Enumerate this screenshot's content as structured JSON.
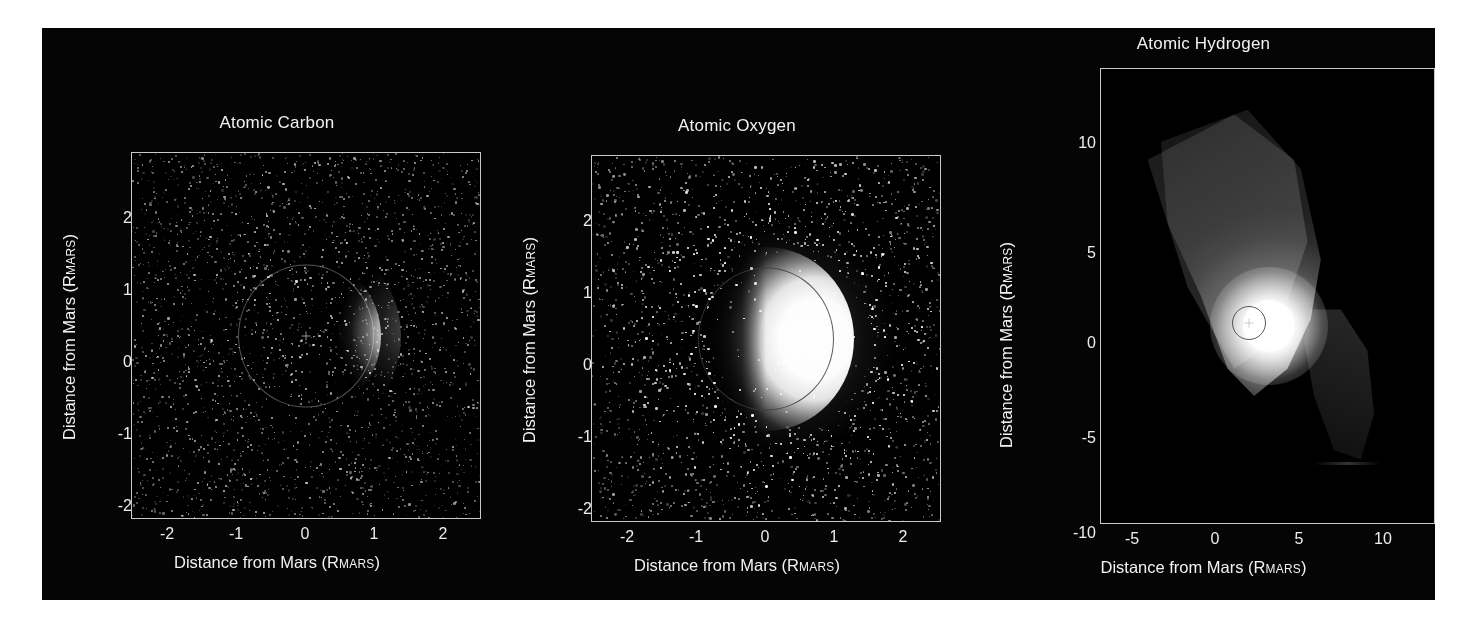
{
  "figure": {
    "background_color": "#050505",
    "text_color": "#f2f2f2",
    "box_color": "#c9c9c9"
  },
  "chart_data": [
    {
      "type": "heatmap",
      "title": "Atomic Carbon",
      "xlabel": "Distance from Mars (RMARS)",
      "ylabel": "Distance from Mars (RMARS)",
      "xlabel_main": "Distance from Mars (R",
      "xlabel_sub": "MARS",
      "xlabel_end": ")",
      "xticks": [
        "-2",
        "-1",
        "0",
        "1",
        "2"
      ],
      "xtick_values": [
        -2,
        -1,
        0,
        1,
        2
      ],
      "yticks": [
        "2",
        "1",
        "0",
        "-1",
        "-2"
      ],
      "ytick_values": [
        2,
        1,
        0,
        -1,
        -2
      ],
      "xlim": [
        -2.55,
        2.55
      ],
      "ylim": [
        -2.55,
        2.55
      ],
      "grid": false,
      "colormap": "grayscale",
      "description": "Faint noisy crescent of carbon emission on the dayside (right) limb of Mars with a thin reference circle at 1 RMARS; sparse speckle noise fills the field.",
      "mars_radius_rmars": 1.0,
      "peak_brightness": "limb at +1 RMARS on right side",
      "signal_level": "low"
    },
    {
      "type": "heatmap",
      "title": "Atomic Oxygen",
      "xlabel": "Distance from Mars (RMARS)",
      "ylabel": "Distance from Mars (RMARS)",
      "xlabel_main": "Distance from Mars (R",
      "xlabel_sub": "MARS",
      "xlabel_end": ")",
      "xticks": [
        "-2",
        "-1",
        "0",
        "1",
        "2"
      ],
      "xtick_values": [
        -2,
        -1,
        0,
        1,
        2
      ],
      "yticks": [
        "2",
        "1",
        "0",
        "-1",
        "-2"
      ],
      "ytick_values": [
        2,
        1,
        0,
        -1,
        -2
      ],
      "xlim": [
        -2.55,
        2.55
      ],
      "ylim": [
        -2.55,
        2.55
      ],
      "grid": false,
      "colormap": "grayscale",
      "description": "Bright saturated crescent of oxygen emission filling the dayside hemisphere out past 1 RMARS, surrounded by a diffuse speckled corona extending to about 2 RMARS.",
      "mars_radius_rmars": 1.0,
      "peak_brightness": "saturated dayside disk",
      "signal_level": "high"
    },
    {
      "type": "heatmap",
      "title": "Atomic Hydrogen",
      "xlabel": "Distance from Mars (RMARS)",
      "ylabel": "Distance from Mars (RMARS)",
      "xlabel_main": "Distance from Mars (R",
      "xlabel_sub": "MARS",
      "xlabel_end": ")",
      "xticks": [
        "-5",
        "0",
        "5",
        "10"
      ],
      "xtick_values": [
        -5,
        0,
        5,
        10
      ],
      "yticks": [
        "10",
        "5",
        "0",
        "-5",
        "-10"
      ],
      "ytick_values": [
        10,
        5,
        0,
        -5,
        -10
      ],
      "xlim": [
        -8.6,
        11.2
      ],
      "ylim": [
        -11.6,
        12.3
      ],
      "grid": false,
      "colormap": "grayscale",
      "description": "Extended hydrogen corona: a bright saturated core at Mars surrounded by a broad wedge-shaped swath of emission running from upper-left to the core plus a second fainter swath toward lower-right; coverage gaps appear black.",
      "mars_radius_rmars": 1.0,
      "peak_brightness": "saturated core at 0,0",
      "signal_level": "very high, extended to >10 RMARS"
    }
  ]
}
